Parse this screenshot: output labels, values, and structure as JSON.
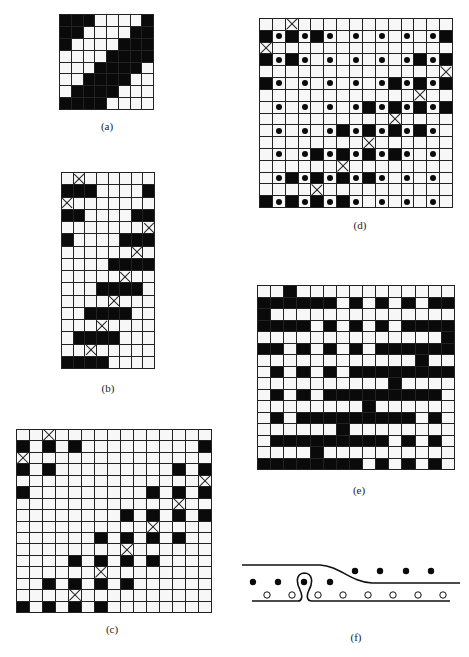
{
  "figure": {
    "panels": [
      {
        "id": "a",
        "label": "(a)",
        "box": {
          "x": 59,
          "y": 14,
          "w": 95,
          "h": 96
        },
        "cols": 8,
        "rows": 8,
        "grid": [
          "BBB....B",
          "BB....BB",
          "B....BBB",
          "....BBBB",
          "...BBBB.",
          "..BBBB..",
          ".BBBB...",
          "BBBB...."
        ],
        "label_pos": {
          "x": 107,
          "y": 126
        }
      },
      {
        "id": "b",
        "label": "(b)",
        "box": {
          "x": 61,
          "y": 172,
          "w": 94,
          "h": 197
        },
        "cols": 8,
        "rows": 16,
        "grid": [
          ".X......",
          "BBB....B",
          "X.......",
          "BB....BB",
          ".......X",
          "B....BBB",
          "......X.",
          "....BBBB",
          ".....X..",
          "...BBBB.",
          "....X...",
          "..BBBB..",
          "...X....",
          ".BBBB...",
          "..X.....",
          "BBBB...."
        ],
        "label_pos": {
          "x": 108,
          "y": 388
        }
      },
      {
        "id": "c",
        "label": "(c)",
        "box": {
          "x": 16,
          "y": 429,
          "w": 196,
          "h": 184
        },
        "cols": 15,
        "rows": 16,
        "grid": [
          "..X............",
          "B.B.B.........B",
          "X..............",
          "B.B.........B.B",
          "..............X",
          "B.........B.B.B",
          "............X..",
          "........B.B.B.B",
          "..........X....",
          "......B.B.B.B..",
          "........X......",
          "....B.B.B.B....",
          "......X........",
          "..B.B.B.B......",
          "....X..........",
          "B.B.B.B........"
        ],
        "label_pos": {
          "x": 112,
          "y": 629
        }
      },
      {
        "id": "d",
        "label": "(d)",
        "box": {
          "x": 259,
          "y": 18,
          "w": 194,
          "h": 190
        },
        "cols": 15,
        "rows": 16,
        "grid": [
          "..X............",
          "BDBDBD.D.D.D.DB",
          "X..............",
          "BDBD.D.D.D.DBDB",
          "..............X",
          "BD.D.D.D.DBDBDB",
          "............X..",
          ".D.D.D.DBDBDBDB",
          "..........X....",
          ".D.D.DBDBDBDBD.",
          "........X......",
          ".D.DBDBDBDBD.D.",
          "......X........",
          ".DBDBDBDBD.D.D.",
          "....X..........",
          "BDBDBDBD.D.D.D."
        ],
        "label_pos": {
          "x": 360,
          "y": 225
        }
      },
      {
        "id": "e",
        "label": "(e)",
        "box": {
          "x": 257,
          "y": 285,
          "w": 198,
          "h": 185
        },
        "cols": 15,
        "rows": 16,
        "grid": [
          "..B............",
          "BBBBBB.B.B.B.BB",
          "B..............",
          "BBBB.B.B.B.BBBB",
          "..............B",
          "BB.B.B.B.BBBBBB",
          "............B..",
          ".B.B.B.BBBBBBBB",
          "..........B....",
          ".B.B.BBBBBBBBB.",
          "........B......",
          ".B.BBBBBBBBB.B.",
          "......B........",
          ".BBBBBBBBB.B.B.",
          "....B..........",
          "BBBBBBBB.B.B.B."
        ],
        "label_pos": {
          "x": 359,
          "y": 490
        }
      }
    ],
    "panel_f": {
      "label": "(f)",
      "label_pos": {
        "x": 356,
        "y": 637
      },
      "filled_dots_upper": [
        [
          355,
          571
        ],
        [
          380,
          571
        ],
        [
          406,
          571
        ],
        [
          431,
          571
        ]
      ],
      "filled_dots_lower": [
        [
          253,
          582
        ],
        [
          278,
          582
        ],
        [
          304,
          582
        ],
        [
          330,
          582
        ]
      ],
      "open_circles": [
        [
          267,
          595
        ],
        [
          292,
          595
        ],
        [
          318,
          595
        ],
        [
          343,
          595
        ],
        [
          368,
          595
        ],
        [
          393,
          595
        ],
        [
          418,
          595
        ],
        [
          443,
          595
        ]
      ]
    },
    "legend": {
      "B": "black cell",
      "X": "crossed cell",
      "D": "dot cell",
      ".": "empty cell"
    }
  }
}
